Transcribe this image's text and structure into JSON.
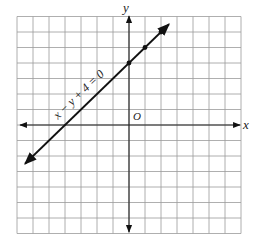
{
  "chart_data": {
    "type": "line",
    "title": "",
    "xlabel": "x",
    "ylabel": "y",
    "origin_label": "O",
    "xlim": [
      -7,
      7
    ],
    "ylim": [
      -7,
      7
    ],
    "grid": true,
    "series": [
      {
        "name": "x − y + 4 = 0",
        "equation": "y = x + 4",
        "x": [
          -6.5,
          2.5
        ],
        "y": [
          -2.5,
          6.5
        ],
        "marked_points": [
          [
            0,
            4
          ],
          [
            1,
            5
          ],
          [
            2,
            6
          ]
        ]
      }
    ],
    "annotations": [
      {
        "text": "x − y + 4 = 0",
        "position": "along line, upper-left of line",
        "rotation": -45
      }
    ]
  },
  "labels": {
    "x_axis": "x",
    "y_axis": "y",
    "origin": "O",
    "equation": "x − y + 4 = 0"
  },
  "colors": {
    "grid": "#9a9a9a",
    "axis": "#222222",
    "line": "#111111"
  }
}
